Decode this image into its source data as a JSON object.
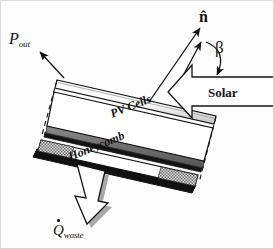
{
  "figure": {
    "type": "schematic-diagram"
  },
  "labels": {
    "power_out": "P",
    "power_out_sub": "out",
    "normal_vector": "n̂",
    "tilt_angle": "β",
    "solar": "Solar",
    "waste_heat": "Q",
    "waste_heat_sub": "waste",
    "layer_top": "PV Cells",
    "layer_core": "Honeycomb"
  },
  "colors": {
    "stroke": "#141414",
    "glass_face": "#ffffff",
    "glass_shade": "#bdbdbd",
    "pv_band": "#6f6f6f",
    "pv_band_dark": "#1c1c1c",
    "body_face": "#ffffff",
    "honeycomb_fill": "#c9c9c9",
    "back_plate": "#111111",
    "arrow_fill": "#ffffff",
    "shadow": "#9a9a9a"
  },
  "geometry": {
    "panel_tilt_deg": -22,
    "solar_arrow_direction": "left",
    "waste_arrow_direction": "down-left",
    "power_arrow_direction": "up-left"
  }
}
